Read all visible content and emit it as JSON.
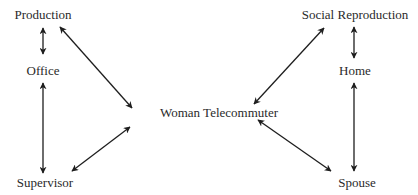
{
  "diagram": {
    "type": "concept-relationship",
    "nodes": {
      "production": {
        "label": "Production"
      },
      "office": {
        "label": "Office"
      },
      "supervisor": {
        "label": "Supervisor"
      },
      "social_reproduction": {
        "label": "Social Reproduction"
      },
      "home": {
        "label": "Home"
      },
      "spouse": {
        "label": "Spouse"
      },
      "woman_telecommuter": {
        "label": "Woman Telecommuter"
      }
    },
    "edges": [
      {
        "from": "production",
        "to": "office",
        "direction": "bidirectional"
      },
      {
        "from": "office",
        "to": "supervisor",
        "direction": "bidirectional"
      },
      {
        "from": "production",
        "to": "woman_telecommuter",
        "direction": "bidirectional"
      },
      {
        "from": "supervisor",
        "to": "woman_telecommuter",
        "direction": "bidirectional"
      },
      {
        "from": "social_reproduction",
        "to": "home",
        "direction": "bidirectional"
      },
      {
        "from": "home",
        "to": "spouse",
        "direction": "bidirectional"
      },
      {
        "from": "social_reproduction",
        "to": "woman_telecommuter",
        "direction": "bidirectional"
      },
      {
        "from": "spouse",
        "to": "woman_telecommuter",
        "direction": "bidirectional"
      }
    ],
    "colors": {
      "background": "#ffffff",
      "text": "#2a2a2a",
      "arrow": "#1e1e1e"
    }
  }
}
